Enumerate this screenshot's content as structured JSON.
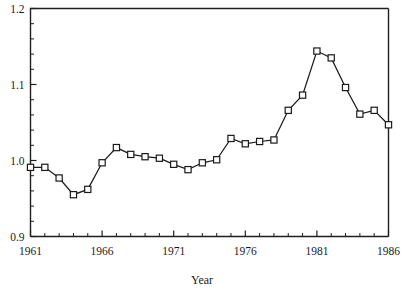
{
  "chart_data": {
    "type": "line",
    "title": "",
    "xlabel": "Year",
    "ylabel": "",
    "xlim": [
      1961,
      1986
    ],
    "ylim": [
      0.9,
      1.2
    ],
    "grid": false,
    "legend": null,
    "marker": "square-open",
    "x_tick_labels": [
      "1961",
      "1966",
      "1971",
      "1976",
      "1981",
      "1986"
    ],
    "x_tick_values": [
      1961,
      1966,
      1971,
      1976,
      1981,
      1986
    ],
    "x_minor_step": 1,
    "y_tick_labels": [
      "0.9",
      "1.0",
      "1.1",
      "1.2"
    ],
    "y_tick_values": [
      0.9,
      1.0,
      1.1,
      1.2
    ],
    "y_minor_step": 0.02,
    "x": [
      1961,
      1962,
      1963,
      1964,
      1965,
      1966,
      1967,
      1968,
      1969,
      1970,
      1971,
      1972,
      1973,
      1974,
      1975,
      1976,
      1977,
      1978,
      1979,
      1980,
      1981,
      1982,
      1983,
      1984,
      1985,
      1986
    ],
    "values": [
      0.991,
      0.991,
      0.977,
      0.955,
      0.962,
      0.997,
      1.017,
      1.008,
      1.005,
      1.003,
      0.995,
      0.988,
      0.997,
      1.001,
      1.029,
      1.022,
      1.025,
      1.027,
      1.066,
      1.086,
      1.144,
      1.135,
      1.096,
      1.061,
      1.066,
      1.047
    ]
  },
  "accent_color": "#1a1a1a"
}
